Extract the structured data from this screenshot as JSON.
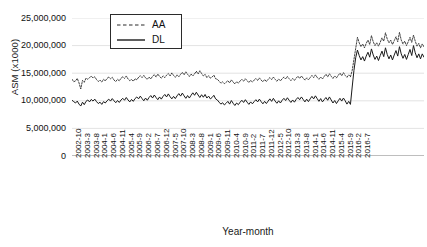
{
  "chart_data": {
    "type": "line",
    "title": "",
    "xlabel": "Year-month",
    "ylabel": "ASM (x1000)",
    "ylim": [
      0,
      25000000
    ],
    "ytick_values": [
      0,
      5000000,
      10000000,
      15000000,
      20000000,
      25000000
    ],
    "ytick_labels": [
      "0",
      "5,000,000",
      "10,000,000",
      "15,000,000",
      "20,000,000",
      "25,000,000"
    ],
    "grid": true,
    "legend_position": "top-left-inside",
    "x_start": "2002-10",
    "x_end": "2016-7",
    "x_tick_interval_months": 5,
    "xtick_labels": [
      "2002-10",
      "2003-3",
      "2003-8",
      "2004-1",
      "2004-6",
      "2004-11",
      "2005-4",
      "2005-9",
      "2006-2",
      "2006-7",
      "2006-12",
      "2007-5",
      "2007-10",
      "2008-3",
      "2008-8",
      "2009-1",
      "2009-6",
      "2009-11",
      "2010-4",
      "2010-9",
      "2011-2",
      "2011-7",
      "2011-12",
      "2012-5",
      "2012-10",
      "2013-3",
      "2013-8",
      "2014-1",
      "2014-6",
      "2014-11",
      "2015-4",
      "2015-9",
      "2016-2",
      "2016-7"
    ],
    "series": [
      {
        "name": "AA",
        "style": "dashed",
        "color": "#2b2b2b",
        "values": [
          13900000,
          13450000,
          13600000,
          14050000,
          13250000,
          12150000,
          13700000,
          13350000,
          14100000,
          13900000,
          14200000,
          14450000,
          14150000,
          14350000,
          13850000,
          13500000,
          13750000,
          13400000,
          13900000,
          13600000,
          14050000,
          14300000,
          14000000,
          14250000,
          13750000,
          13500000,
          13900000,
          13600000,
          14100000,
          14350000,
          14050000,
          14500000,
          13950000,
          13650000,
          13850000,
          13550000,
          14000000,
          13800000,
          14250000,
          14550000,
          14200000,
          14600000,
          14150000,
          13900000,
          14300000,
          13950000,
          14450000,
          14750000,
          14300000,
          14850000,
          14400000,
          14100000,
          14500000,
          14200000,
          14650000,
          14950000,
          14500000,
          15050000,
          14600000,
          14250000,
          14700000,
          14350000,
          14800000,
          15150000,
          14700000,
          15250000,
          14800000,
          14400000,
          14850000,
          14500000,
          14900000,
          15350000,
          14850000,
          15450000,
          14950000,
          14500000,
          14800000,
          14200000,
          14550000,
          14100000,
          14300000,
          14650000,
          14000000,
          13900000,
          13550000,
          13200000,
          13450000,
          13100000,
          13350000,
          13650000,
          13250000,
          13800000,
          13400000,
          13050000,
          13450000,
          13200000,
          13600000,
          13900000,
          13550000,
          14000000,
          13650000,
          13300000,
          13700000,
          13400000,
          13750000,
          14050000,
          13700000,
          14150000,
          13750000,
          13450000,
          13850000,
          13500000,
          13900000,
          14200000,
          13850000,
          14300000,
          13900000,
          13550000,
          13950000,
          13600000,
          14000000,
          14300000,
          13950000,
          14400000,
          14000000,
          13650000,
          14050000,
          13700000,
          14100000,
          14450000,
          14050000,
          14500000,
          14100000,
          13750000,
          14150000,
          13800000,
          14200000,
          14600000,
          14200000,
          14700000,
          14250000,
          13900000,
          14300000,
          13950000,
          14400000,
          14800000,
          14350000,
          14900000,
          14450000,
          14050000,
          14500000,
          14150000,
          14600000,
          15000000,
          14550000,
          15100000,
          14600000,
          14250000,
          14700000,
          14350000,
          15500000,
          17500000,
          19500000,
          21500000,
          20500000,
          19800000,
          20300000,
          19600000,
          20400000,
          21000000,
          20200000,
          21800000,
          20700000,
          20000000,
          20500000,
          19900000,
          20600000,
          21400000,
          20800000,
          22300000,
          21200000,
          20500000,
          21000000,
          20200000,
          20900000,
          21600000,
          20700000,
          22400000,
          21000000,
          20300000,
          20800000,
          20000000,
          20700000,
          21500000,
          20600000,
          21900000,
          20800000,
          19900000,
          20400000,
          19600000,
          20300000,
          19800000
        ]
      },
      {
        "name": "DL",
        "style": "solid",
        "color": "#1a1a1a",
        "values": [
          10100000,
          9850000,
          9600000,
          9950000,
          9400000,
          9050000,
          9750000,
          9300000,
          9900000,
          10150000,
          9800000,
          10250000,
          9950000,
          10300000,
          9850000,
          9500000,
          9750000,
          9350000,
          9850000,
          9600000,
          10000000,
          10300000,
          9950000,
          10400000,
          10000000,
          9650000,
          10050000,
          9700000,
          10150000,
          10450000,
          10100000,
          10600000,
          10150000,
          9800000,
          10250000,
          9900000,
          10400000,
          10700000,
          10350000,
          10850000,
          10400000,
          10000000,
          10500000,
          10100000,
          10600000,
          10950000,
          10500000,
          11050000,
          10600000,
          10200000,
          10700000,
          10300000,
          10800000,
          11150000,
          10700000,
          11250000,
          10750000,
          10350000,
          10800000,
          10400000,
          10900000,
          11300000,
          10850000,
          11400000,
          10900000,
          10450000,
          10950000,
          10500000,
          11000000,
          11450000,
          11000000,
          11550000,
          11050000,
          10600000,
          11100000,
          10650000,
          11150000,
          10500000,
          10850000,
          10350000,
          10600000,
          11000000,
          10350000,
          10150000,
          9750000,
          9400000,
          9650000,
          9250000,
          9550000,
          9900000,
          9400000,
          10050000,
          9550000,
          9150000,
          9600000,
          9300000,
          9750000,
          10100000,
          9700000,
          10200000,
          9750000,
          9350000,
          9800000,
          9450000,
          9850000,
          10200000,
          9800000,
          10300000,
          9850000,
          9450000,
          9900000,
          9500000,
          9950000,
          10350000,
          9900000,
          10450000,
          9950000,
          9550000,
          10000000,
          9600000,
          10100000,
          10450000,
          10050000,
          10550000,
          10100000,
          9700000,
          10150000,
          9750000,
          10250000,
          10600000,
          10200000,
          10700000,
          10250000,
          9800000,
          10300000,
          9850000,
          10350000,
          10800000,
          10350000,
          10900000,
          10400000,
          9900000,
          10400000,
          9800000,
          10200000,
          10600000,
          10100000,
          10700000,
          10150000,
          9600000,
          10050000,
          9500000,
          10000000,
          10450000,
          9950000,
          10500000,
          10000000,
          9400000,
          9900000,
          9350000,
          12500000,
          15500000,
          17800000,
          19200000,
          18200000,
          17400000,
          18000000,
          17200000,
          18100000,
          18800000,
          17900000,
          19400000,
          18300000,
          17500000,
          18100000,
          17300000,
          18200000,
          19000000,
          18000000,
          19600000,
          18400000,
          17600000,
          18300000,
          17400000,
          18300000,
          19100000,
          18100000,
          19800000,
          18500000,
          17700000,
          18400000,
          17500000,
          18400000,
          19300000,
          18200000,
          20000000,
          18700000,
          17800000,
          18500000,
          17600000,
          18500000,
          17900000
        ]
      }
    ]
  }
}
